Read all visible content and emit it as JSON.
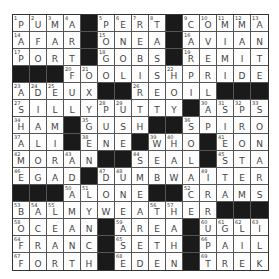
{
  "puzzle": {
    "size": 15,
    "rows": [
      "PUMA#PERT#COMMA",
      "AFAR#ONEA#AVIAN",
      "PORT#GOBS#REMIT",
      "###FOOLISHPRIDE",
      "ADEUX##REOIL###",
      "SILLYPUTTY#ASPS",
      "HAM#GUSH##SPIRO",
      "ALI#ENE#WHO#EON",
      "MORAN##SEAL#STA",
      "EGAD#DUMBWAITER",
      "###ALONE##CRAMS",
      "BALMYWEATHER###",
      "OCEAN#AREA#UGLI",
      "FRANC#SETH#PAIL",
      "FORTH#EDEN#TREK"
    ],
    "numbers": [
      [
        1,
        2,
        3,
        4,
        0,
        5,
        6,
        7,
        8,
        0,
        9,
        10,
        11,
        12,
        13
      ],
      [
        14,
        0,
        0,
        0,
        0,
        15,
        0,
        0,
        0,
        0,
        16,
        0,
        0,
        0,
        0
      ],
      [
        17,
        0,
        0,
        0,
        0,
        18,
        0,
        0,
        0,
        0,
        19,
        0,
        0,
        0,
        0
      ],
      [
        0,
        0,
        0,
        20,
        21,
        0,
        0,
        0,
        0,
        22,
        0,
        0,
        0,
        0,
        0
      ],
      [
        23,
        24,
        25,
        0,
        0,
        0,
        0,
        26,
        0,
        0,
        0,
        0,
        0,
        0,
        0
      ],
      [
        27,
        0,
        0,
        0,
        0,
        28,
        29,
        0,
        0,
        0,
        0,
        30,
        31,
        32,
        33
      ],
      [
        34,
        0,
        0,
        0,
        35,
        0,
        0,
        0,
        0,
        0,
        36,
        0,
        0,
        0,
        0
      ],
      [
        37,
        0,
        0,
        0,
        38,
        0,
        0,
        0,
        39,
        40,
        0,
        0,
        41,
        0,
        0
      ],
      [
        42,
        0,
        0,
        43,
        0,
        0,
        0,
        44,
        0,
        0,
        0,
        0,
        45,
        0,
        0
      ],
      [
        46,
        0,
        0,
        0,
        0,
        47,
        48,
        0,
        0,
        0,
        0,
        49,
        0,
        0,
        0
      ],
      [
        0,
        0,
        0,
        50,
        51,
        0,
        0,
        0,
        0,
        0,
        52,
        0,
        0,
        0,
        0
      ],
      [
        53,
        54,
        55,
        0,
        0,
        0,
        0,
        0,
        56,
        57,
        0,
        0,
        0,
        0,
        0
      ],
      [
        58,
        0,
        0,
        0,
        0,
        0,
        59,
        0,
        0,
        0,
        0,
        60,
        61,
        62,
        63
      ],
      [
        64,
        0,
        0,
        0,
        0,
        0,
        65,
        0,
        0,
        0,
        0,
        66,
        0,
        0,
        0
      ],
      [
        67,
        0,
        0,
        0,
        0,
        0,
        68,
        0,
        0,
        0,
        0,
        69,
        0,
        0,
        0
      ]
    ]
  },
  "colors": {
    "black_square": "#1a1a1a",
    "white_square": "#fdfdfd",
    "grid_line": "#555555",
    "letter": "#444444"
  }
}
